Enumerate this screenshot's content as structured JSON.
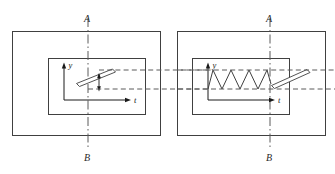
{
  "figure": {
    "clipped_header_text": "—— ———— ————— —— ——— ———— —— ———",
    "stroke_color": "#404040",
    "dash_color": "#5a5a5a",
    "background_color": "#ffffff"
  },
  "panels": [
    {
      "id": "left-panel",
      "name": "left-panel",
      "centerline": {
        "top_label": "A",
        "bottom_label": "B"
      },
      "axes": {
        "vertical_label": "y",
        "horizontal_label": "t"
      },
      "content": {
        "type": "inclined-bar-with-amplitude-arrow",
        "has_zigzag": false,
        "has_double_arrow": true
      }
    },
    {
      "id": "right-panel",
      "name": "right-panel",
      "centerline": {
        "top_label": "A",
        "bottom_label": "B"
      },
      "axes": {
        "vertical_label": "y",
        "horizontal_label": "t"
      },
      "content": {
        "type": "zigzag-waveform-with-inclined-bar",
        "has_zigzag": true,
        "zigzag_peaks": 3,
        "has_double_arrow": false
      }
    }
  ],
  "connectors": {
    "horizontal_dashed_lines": 2,
    "vertical_dashdot_lines": 2
  }
}
